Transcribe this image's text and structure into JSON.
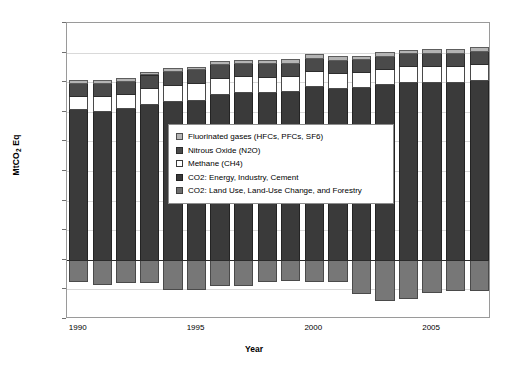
{
  "chart_data": {
    "type": "bar",
    "stacked": true,
    "title": "",
    "xlabel": "Year",
    "ylabel": "MtCO2 Eq",
    "ylabel_html": "MtCO<sub>2</sub> Eq",
    "ylim": [
      -2000,
      8000
    ],
    "ytick_values": [
      8000,
      7000,
      6000,
      5000,
      4000,
      3000,
      2000,
      1000,
      0,
      -1000,
      -2000
    ],
    "ytick_labels": [
      "8,000",
      "7,000",
      "6,000",
      "5,000",
      "4,000",
      "3,000",
      "2,000",
      "1,000",
      "0",
      "-1,000",
      "-2,000"
    ],
    "xtick_labels": [
      "1990",
      "1995",
      "2000",
      "2005"
    ],
    "xtick_categories": [
      1990,
      1995,
      2000,
      2005
    ],
    "grid": true,
    "legend_position": "center",
    "categories": [
      "1990",
      "1991",
      "1992",
      "1993",
      "1994",
      "1995",
      "1996",
      "1997",
      "1998",
      "1999",
      "2000",
      "2001",
      "2002",
      "2003",
      "2004",
      "2005",
      "2006",
      "2007"
    ],
    "series": [
      {
        "name": "CO2: Energy, Industry, Cement",
        "color": "#3a3a3a",
        "values": [
          5080,
          5040,
          5120,
          5270,
          5360,
          5410,
          5600,
          5660,
          5660,
          5700,
          5880,
          5800,
          5830,
          5930,
          6000,
          6020,
          5990,
          6060
        ]
      },
      {
        "name": "Methane (CH4)",
        "color": "#ffffff",
        "values": [
          470,
          490,
          470,
          540,
          560,
          560,
          540,
          540,
          530,
          520,
          510,
          520,
          520,
          530,
          540,
          540,
          560,
          560
        ]
      },
      {
        "name": "Nitrous Oxide (N2O)",
        "color": "#4a4a4a",
        "values": [
          430,
          440,
          450,
          450,
          460,
          460,
          460,
          450,
          450,
          440,
          440,
          440,
          430,
          430,
          430,
          430,
          430,
          430
        ]
      },
      {
        "name": "Fluorinated gases (HFCs, PFCs, SF6)",
        "color": "#b4b4b4",
        "values": [
          90,
          90,
          90,
          90,
          90,
          100,
          110,
          110,
          120,
          120,
          120,
          120,
          120,
          130,
          130,
          130,
          130,
          130
        ]
      },
      {
        "name": "CO2: Land Use, Land-Use Change, and Forestry",
        "color": "#777777",
        "values": [
          -760,
          -840,
          -800,
          -780,
          -1030,
          -1020,
          -880,
          -880,
          -760,
          -700,
          -760,
          -760,
          -1160,
          -1390,
          -1330,
          -1120,
          -1070,
          -1070
        ]
      }
    ],
    "legend_entries": [
      "Fluorinated gases (HFCs, PFCs, SF6)",
      "Nitrous Oxide (N2O)",
      "Methane (CH4)",
      "CO2: Energy, Industry, Cement",
      "CO2: Land Use, Land-Use Change, and Forestry"
    ]
  }
}
